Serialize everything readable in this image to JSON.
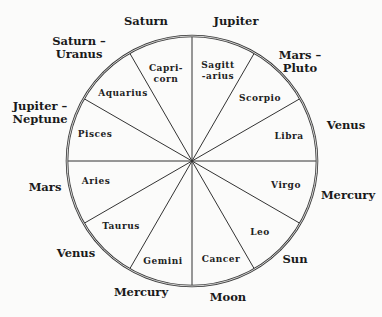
{
  "wheel": {
    "center": [
      192,
      161
    ],
    "radius": 125,
    "spoke_angles_deg": [
      0,
      30,
      60,
      90,
      120,
      150,
      180,
      210,
      240,
      270,
      300,
      330
    ],
    "rim_color": "#3a3a3a"
  },
  "signs": [
    {
      "name": "Capricorn",
      "lines": [
        "Capri-",
        "corn"
      ],
      "x": 166,
      "y": 71
    },
    {
      "name": "Sagittarius",
      "lines": [
        "Sagitt",
        "-arius"
      ],
      "x": 218,
      "y": 68
    },
    {
      "name": "Scorpio",
      "lines": [
        "Scorpio"
      ],
      "x": 260,
      "y": 101
    },
    {
      "name": "Libra",
      "lines": [
        "Libra"
      ],
      "x": 289,
      "y": 139
    },
    {
      "name": "Virgo",
      "lines": [
        "Virgo"
      ],
      "x": 286,
      "y": 188
    },
    {
      "name": "Leo",
      "lines": [
        "Leo"
      ],
      "x": 260,
      "y": 235
    },
    {
      "name": "Cancer",
      "lines": [
        "Cancer"
      ],
      "x": 221,
      "y": 262
    },
    {
      "name": "Gemini",
      "lines": [
        "Gemini"
      ],
      "x": 163,
      "y": 264
    },
    {
      "name": "Taurus",
      "lines": [
        "Taurus"
      ],
      "x": 121,
      "y": 229
    },
    {
      "name": "Aries",
      "lines": [
        "Aries"
      ],
      "x": 96,
      "y": 184
    },
    {
      "name": "Pisces",
      "lines": [
        "Pisces"
      ],
      "x": 95,
      "y": 137
    },
    {
      "name": "Aquarius",
      "lines": [
        "Aquarius"
      ],
      "x": 123,
      "y": 96
    }
  ],
  "rulers": [
    {
      "label": [
        "Saturn"
      ],
      "x": 146,
      "y": 25
    },
    {
      "label": [
        "Jupiter"
      ],
      "x": 236,
      "y": 25
    },
    {
      "label": [
        "Mars –",
        "Pluto"
      ],
      "x": 300,
      "y": 59
    },
    {
      "label": [
        "Venus"
      ],
      "x": 346,
      "y": 129
    },
    {
      "label": [
        "Mercury"
      ],
      "x": 348,
      "y": 199
    },
    {
      "label": [
        "Sun"
      ],
      "x": 295,
      "y": 263
    },
    {
      "label": [
        "Moon"
      ],
      "x": 228,
      "y": 301
    },
    {
      "label": [
        "Mercury"
      ],
      "x": 141,
      "y": 296
    },
    {
      "label": [
        "Venus"
      ],
      "x": 76,
      "y": 257
    },
    {
      "label": [
        "Mars"
      ],
      "x": 45,
      "y": 191
    },
    {
      "label": [
        "Jupiter –",
        "Neptune"
      ],
      "x": 40,
      "y": 110
    },
    {
      "label": [
        "Saturn –",
        "Uranus"
      ],
      "x": 79,
      "y": 45
    }
  ]
}
